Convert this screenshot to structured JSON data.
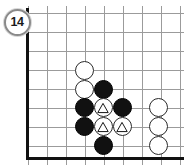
{
  "figure": {
    "number_label": "14",
    "badge": {
      "cx": 17,
      "cy": 22,
      "d": 27,
      "font_size": 12.5
    }
  },
  "colors": {
    "background": "#ffffff",
    "grid_line": "#9b9b9b",
    "board_edge": "#111111",
    "black_stone": "#111111",
    "white_stone": "#ffffff",
    "white_stone_outline": "#2a2a2a",
    "badge_outline": "#8a8a8a",
    "mark_stroke": "#111111"
  },
  "board": {
    "type": "go-board-diagram",
    "origin_x": 28,
    "origin_y": 13,
    "cell": 19,
    "cols": 9,
    "rows": 8,
    "stone_diameter": 19,
    "clip_right": true,
    "clip_top": true,
    "edges": [
      {
        "side": "left",
        "x": 26,
        "y": 8,
        "w": 3,
        "h": 152
      },
      {
        "side": "bottom",
        "x": 26,
        "y": 157,
        "w": 158,
        "h": 3
      }
    ]
  },
  "stones": [
    {
      "color": "white",
      "col": 3,
      "row": 3,
      "mark": "none",
      "x": 84,
      "y": 70
    },
    {
      "color": "white",
      "col": 3,
      "row": 4,
      "mark": "none",
      "x": 84,
      "y": 89
    },
    {
      "color": "black",
      "col": 4,
      "row": 4,
      "mark": "none",
      "x": 103,
      "y": 89
    },
    {
      "color": "black",
      "col": 3,
      "row": 5,
      "mark": "none",
      "x": 84,
      "y": 107
    },
    {
      "color": "white",
      "col": 4,
      "row": 5,
      "mark": "triangle",
      "x": 103,
      "y": 107
    },
    {
      "color": "black",
      "col": 5,
      "row": 5,
      "mark": "none",
      "x": 122,
      "y": 107
    },
    {
      "color": "black",
      "col": 3,
      "row": 6,
      "mark": "none",
      "x": 84,
      "y": 126
    },
    {
      "color": "white",
      "col": 4,
      "row": 6,
      "mark": "triangle",
      "x": 103,
      "y": 126
    },
    {
      "color": "white",
      "col": 5,
      "row": 6,
      "mark": "triangle",
      "x": 122,
      "y": 126
    },
    {
      "color": "black",
      "col": 4,
      "row": 7,
      "mark": "none",
      "x": 103,
      "y": 145
    },
    {
      "color": "white",
      "col": 7,
      "row": 5,
      "mark": "none",
      "x": 158,
      "y": 107
    },
    {
      "color": "white",
      "col": 7,
      "row": 6,
      "mark": "none",
      "x": 158,
      "y": 126
    },
    {
      "color": "white",
      "col": 7,
      "row": 7,
      "mark": "none",
      "x": 158,
      "y": 145
    }
  ]
}
